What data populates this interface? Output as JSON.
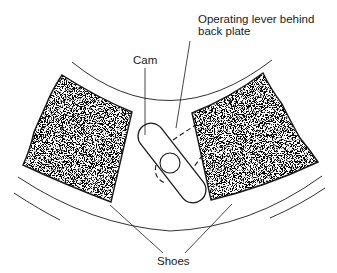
{
  "diagram": {
    "labels": {
      "operating_lever_line1": "Operating lever behind",
      "operating_lever_line2": "back plate",
      "cam": "Cam",
      "shoes": "Shoes"
    },
    "components": [
      {
        "id": "left-shoe",
        "kind": "brake-shoe-lining",
        "fill": "stippled"
      },
      {
        "id": "right-shoe",
        "kind": "brake-shoe-lining",
        "fill": "stippled"
      },
      {
        "id": "cam",
        "kind": "cam",
        "shape": "rounded-slot"
      },
      {
        "id": "cam-pivot",
        "kind": "pivot-circle"
      },
      {
        "id": "operating-lever",
        "kind": "hidden-lever",
        "style": "dashed"
      },
      {
        "id": "inner-arc",
        "kind": "drum-arc"
      },
      {
        "id": "outer-arc",
        "kind": "drum-arc"
      }
    ],
    "colors": {
      "line": "#1a1a1a",
      "background": "#ffffff",
      "stipple_dark": "#222222",
      "stipple_light": "#ffffff"
    }
  }
}
